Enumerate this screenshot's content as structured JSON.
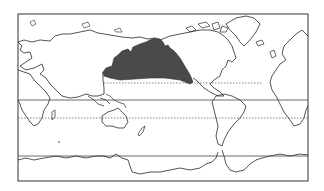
{
  "map": {
    "projection": "Pacific-centered world map",
    "colors": {
      "land_outline": "#2a2a2a",
      "frame": "#333333",
      "shaded_region": "#4a4a4a",
      "background": "#ffffff"
    },
    "reference_lines": [
      {
        "name": "tropic-of-cancer",
        "style": "dotted"
      },
      {
        "name": "equator",
        "style": "solid"
      },
      {
        "name": "tropic-of-capricorn",
        "style": "dotted"
      },
      {
        "name": "antarctic-circle",
        "style": "solid"
      }
    ],
    "shaded_region": "North Pacific Ocean"
  }
}
